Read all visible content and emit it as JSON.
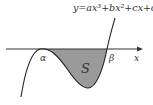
{
  "diagram": {
    "equation": "y=ax³+bx²+cx+d",
    "axis_label": "x",
    "root_alpha": "α",
    "root_beta": "β",
    "region_label": "S",
    "colors": {
      "curve": "#222222",
      "axis": "#333333",
      "shade": "#9a9a9a"
    }
  }
}
